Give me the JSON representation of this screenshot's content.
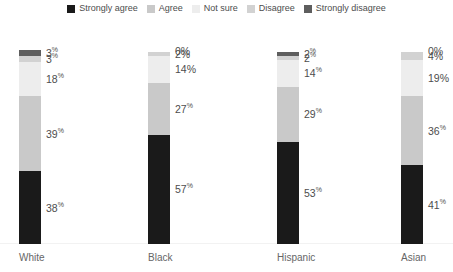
{
  "legend": {
    "position": "top-center",
    "items": [
      {
        "label": "Strongly agree",
        "color": "#1a1a1a",
        "icon": "square-swatch-icon"
      },
      {
        "label": "Agree",
        "color": "#c9c9c9",
        "icon": "square-swatch-icon"
      },
      {
        "label": "Not sure",
        "color": "#ededed",
        "icon": "square-swatch-icon"
      },
      {
        "label": "Disagree",
        "color": "#d2d2d2",
        "icon": "square-swatch-icon"
      },
      {
        "label": "Strongly disagree",
        "color": "#5e5e5e",
        "icon": "square-swatch-icon"
      }
    ]
  },
  "chart_data": {
    "type": "bar",
    "subtype": "stacked-vertical-100pct",
    "title": "",
    "subtitle": "",
    "xlabel": "",
    "ylabel": "",
    "ylim": [
      0,
      100
    ],
    "grid": false,
    "legend_position": "top",
    "categories": [
      "White",
      "Black",
      "Hispanic",
      "Asian"
    ],
    "series": [
      {
        "name": "Strongly agree",
        "color": "#1a1a1a",
        "values": [
          38,
          57,
          53,
          41
        ]
      },
      {
        "name": "Agree",
        "color": "#c9c9c9",
        "values": [
          39,
          27,
          29,
          36
        ]
      },
      {
        "name": "Not sure",
        "color": "#ededed",
        "values": [
          18,
          14,
          14,
          19
        ]
      },
      {
        "name": "Disagree",
        "color": "#d2d2d2",
        "values": [
          3,
          2,
          2,
          4
        ]
      },
      {
        "name": "Strongly disagree",
        "color": "#5e5e5e",
        "values": [
          3,
          0,
          2,
          0
        ]
      }
    ],
    "bars": [
      {
        "category": "White",
        "segments": [
          {
            "series": "Strongly agree",
            "value": 38,
            "label": "38",
            "suffix": "%",
            "color": "#1a1a1a"
          },
          {
            "series": "Agree",
            "value": 39,
            "label": "39",
            "suffix": "%",
            "color": "#c9c9c9"
          },
          {
            "series": "Not sure",
            "value": 18,
            "label": "18",
            "suffix": "%",
            "color": "#ededed"
          },
          {
            "series": "Disagree",
            "value": 3,
            "label": "3",
            "suffix": "%",
            "color": "#d2d2d2"
          },
          {
            "series": "Strongly disagree",
            "value": 3,
            "label": "3",
            "suffix": "%",
            "color": "#5e5e5e"
          }
        ]
      },
      {
        "category": "Black",
        "segments": [
          {
            "series": "Strongly agree",
            "value": 57,
            "label": "57",
            "suffix": "%",
            "color": "#1a1a1a"
          },
          {
            "series": "Agree",
            "value": 27,
            "label": "27",
            "suffix": "%",
            "color": "#c9c9c9"
          },
          {
            "series": "Not sure",
            "value": 14,
            "label": "14%",
            "suffix": "",
            "color": "#ededed"
          },
          {
            "series": "Disagree",
            "value": 2,
            "label": "2%",
            "suffix": "",
            "color": "#d2d2d2"
          },
          {
            "series": "Strongly disagree",
            "value": 0,
            "label": "0%",
            "suffix": "",
            "color": "#5e5e5e"
          }
        ]
      },
      {
        "category": "Hispanic",
        "segments": [
          {
            "series": "Strongly agree",
            "value": 53,
            "label": "53",
            "suffix": "%",
            "color": "#1a1a1a"
          },
          {
            "series": "Agree",
            "value": 29,
            "label": "29",
            "suffix": "%",
            "color": "#c9c9c9"
          },
          {
            "series": "Not sure",
            "value": 14,
            "label": "14",
            "suffix": "%",
            "color": "#ededed"
          },
          {
            "series": "Disagree",
            "value": 2,
            "label": "2",
            "suffix": "%",
            "color": "#d2d2d2"
          },
          {
            "series": "Strongly disagree",
            "value": 2,
            "label": "2",
            "suffix": "%",
            "color": "#5e5e5e"
          }
        ]
      },
      {
        "category": "Asian",
        "segments": [
          {
            "series": "Strongly agree",
            "value": 41,
            "label": "41",
            "suffix": "%",
            "color": "#1a1a1a"
          },
          {
            "series": "Agree",
            "value": 36,
            "label": "36",
            "suffix": "%",
            "color": "#c9c9c9"
          },
          {
            "series": "Not sure",
            "value": 19,
            "label": "19%",
            "suffix": "",
            "color": "#ededed"
          },
          {
            "series": "Disagree",
            "value": 4,
            "label": "4%",
            "suffix": "",
            "color": "#d2d2d2"
          },
          {
            "series": "Strongly disagree",
            "value": 0,
            "label": "0%",
            "suffix": "",
            "color": "#5e5e5e"
          }
        ]
      }
    ]
  },
  "layout": {
    "bar_left_px": [
      19,
      148,
      277,
      401
    ],
    "bar_width_px": 22,
    "plot_height_px": 192,
    "background": "#ffffff",
    "text_color": "#4d4d4d"
  }
}
